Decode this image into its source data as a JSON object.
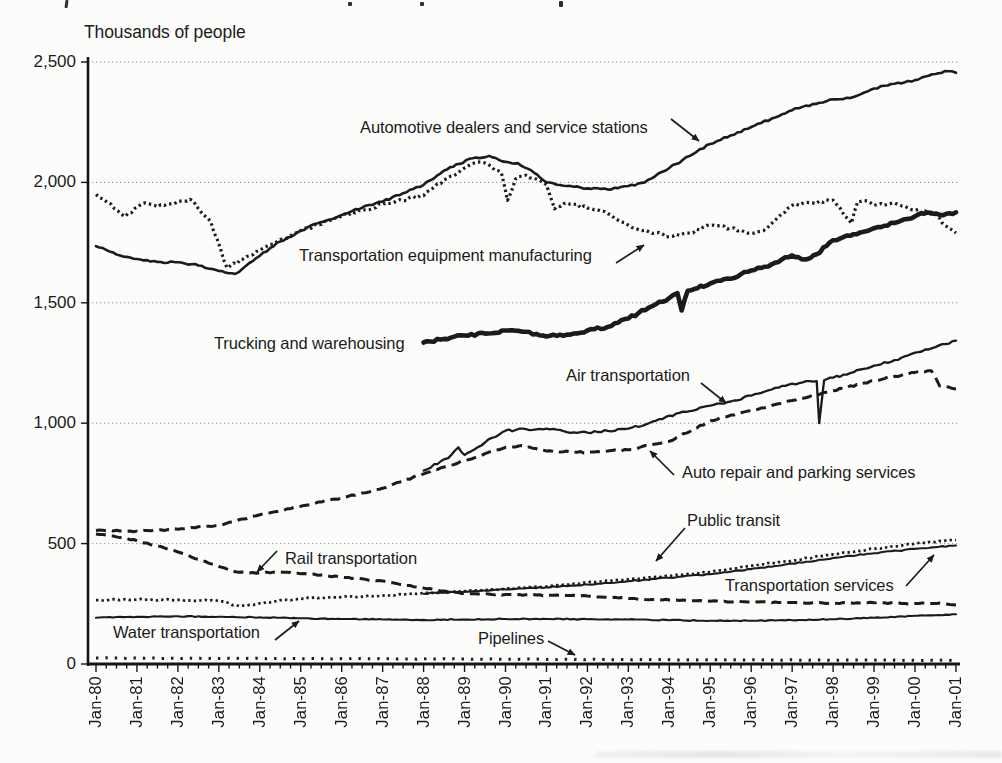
{
  "figure": {
    "y_axis_title": "Thousands of people",
    "ink_color": "#1b1b1b",
    "background_color": "#fcfcfb"
  },
  "chart_data": {
    "type": "line",
    "title": "",
    "ylabel": "Thousands of people",
    "xlabel": "",
    "ylim": [
      0,
      2500
    ],
    "x_range": [
      "Jan-80",
      "Jan-01"
    ],
    "grid": "horizontal dotted gridlines every 500",
    "legend_position": "inline annotations with arrows",
    "y_ticks": [
      {
        "v": 0,
        "label": "0"
      },
      {
        "v": 500,
        "label": "500"
      },
      {
        "v": 1000,
        "label": "1,000"
      },
      {
        "v": 1500,
        "label": "1,500"
      },
      {
        "v": 2000,
        "label": "2,000"
      },
      {
        "v": 2500,
        "label": "2,500"
      }
    ],
    "x_tick_labels": [
      "Jan-80",
      "Jan-81",
      "Jan-82",
      "Jan-83",
      "Jan-84",
      "Jan-85",
      "Jan-86",
      "Jan-87",
      "Jan-88",
      "Jan-89",
      "Jan-90",
      "Jan-91",
      "Jan-92",
      "Jan-93",
      "Jan-94",
      "Jan-95",
      "Jan-96",
      "Jan-97",
      "Jan-98",
      "Jan-99",
      "Jan-00",
      "Jan-01"
    ],
    "series": [
      {
        "id": "automotive-dealers",
        "name": "Automotive dealers and service stations",
        "line": "solid",
        "width": 2.6,
        "noise": 1.0,
        "x": [
          1980,
          1980.5,
          1981,
          1981.5,
          1982,
          1982.5,
          1983,
          1983.4,
          1984,
          1984.5,
          1985,
          1985.5,
          1986,
          1986.5,
          1987,
          1987.5,
          1988,
          1988.5,
          1988.8,
          1989.2,
          1989.6,
          1990,
          1990.3,
          1990.7,
          1991,
          1991.5,
          1992,
          1992.5,
          1993,
          1993.4,
          1994,
          1994.5,
          1995,
          1995.5,
          1996,
          1996.5,
          1997,
          1997.5,
          1998,
          1998.5,
          1999,
          1999.5,
          2000,
          2000.5,
          2000.8,
          2001
        ],
        "values": [
          1735,
          1700,
          1682,
          1670,
          1668,
          1655,
          1632,
          1620,
          1695,
          1755,
          1800,
          1835,
          1865,
          1895,
          1920,
          1955,
          1990,
          2050,
          2075,
          2100,
          2110,
          2085,
          2080,
          2040,
          2000,
          1985,
          1975,
          1970,
          1985,
          2000,
          2060,
          2110,
          2160,
          2195,
          2230,
          2265,
          2300,
          2325,
          2345,
          2355,
          2390,
          2410,
          2425,
          2450,
          2462,
          2455
        ]
      },
      {
        "id": "transportation-equipment-mfg",
        "name": "Transportation equipment manufacturing",
        "line": "dotted",
        "width": 3.2,
        "noise": 1.6,
        "x": [
          1980,
          1980.2,
          1980.7,
          1981.2,
          1981.5,
          1982,
          1982.3,
          1982.8,
          1983.2,
          1984,
          1985,
          1986,
          1987,
          1988,
          1988.5,
          1989,
          1989.4,
          1989.9,
          1990.05,
          1990.25,
          1990.5,
          1991,
          1991.2,
          1991.5,
          1992,
          1992.5,
          1993,
          1993.5,
          1994,
          1994.5,
          1995,
          1995.5,
          1996,
          1996.3,
          1997,
          1997.5,
          1998,
          1998.45,
          1998.6,
          1998.75,
          1999,
          1999.5,
          2000,
          2000.5,
          2000.75,
          2001
        ],
        "values": [
          1950,
          1928,
          1858,
          1915,
          1898,
          1922,
          1930,
          1838,
          1645,
          1718,
          1800,
          1862,
          1908,
          1945,
          2010,
          2060,
          2085,
          2040,
          1925,
          2015,
          2030,
          1990,
          1890,
          1915,
          1893,
          1870,
          1822,
          1795,
          1775,
          1790,
          1822,
          1810,
          1789,
          1800,
          1905,
          1915,
          1926,
          1830,
          1920,
          1925,
          1905,
          1915,
          1884,
          1868,
          1820,
          1790
        ]
      },
      {
        "id": "trucking-warehousing",
        "name": "Trucking and warehousing",
        "line": "solid",
        "width": 4.6,
        "noise": 1.3,
        "x": [
          1988,
          1988.5,
          1989,
          1989.5,
          1990,
          1990.5,
          1991,
          1991.5,
          1992,
          1992.5,
          1993,
          1993.5,
          1994,
          1994.2,
          1994.3,
          1994.45,
          1995,
          1995.5,
          1996,
          1996.5,
          1997,
          1997.3,
          1997.6,
          1998,
          1998.5,
          1999,
          1999.5,
          2000,
          2000.3,
          2000.6,
          2001
        ],
        "values": [
          1335,
          1350,
          1364,
          1372,
          1385,
          1380,
          1360,
          1368,
          1385,
          1400,
          1435,
          1480,
          1520,
          1540,
          1468,
          1550,
          1580,
          1600,
          1634,
          1660,
          1697,
          1680,
          1702,
          1760,
          1785,
          1810,
          1832,
          1859,
          1875,
          1865,
          1876
        ]
      },
      {
        "id": "air-transportation",
        "name": "Air transportation",
        "line": "solid",
        "width": 2.3,
        "noise": 1.1,
        "x": [
          1988,
          1988.6,
          1988.85,
          1989,
          1989.15,
          1989.5,
          1990,
          1990.5,
          1991,
          1991.5,
          1992,
          1992.5,
          1993,
          1993.5,
          1994,
          1994.5,
          1995,
          1995.5,
          1996,
          1996.5,
          1997,
          1997.6,
          1997.66,
          1997.78,
          1998,
          1998.5,
          1999,
          1999.5,
          2000,
          2000.5,
          2001
        ],
        "values": [
          803,
          855,
          900,
          868,
          882,
          920,
          969,
          975,
          977,
          963,
          961,
          968,
          977,
          1000,
          1031,
          1050,
          1073,
          1090,
          1114,
          1140,
          1164,
          1175,
          1000,
          1178,
          1189,
          1212,
          1239,
          1262,
          1293,
          1316,
          1343
        ]
      },
      {
        "id": "auto-repair-parking",
        "name": "Auto repair and parking services",
        "line": "dashed",
        "width": 3.0,
        "noise": 0.8,
        "x": [
          1980,
          1981,
          1982,
          1983,
          1984,
          1985,
          1986,
          1987,
          1988,
          1989,
          1990,
          1990.4,
          1991,
          1992,
          1993,
          1994,
          1995,
          1996,
          1997,
          1998,
          1999,
          2000,
          2000.4,
          2000.6,
          2001
        ],
        "values": [
          555,
          552,
          560,
          575,
          620,
          655,
          690,
          730,
          790,
          845,
          900,
          907,
          885,
          878,
          890,
          925,
          1010,
          1052,
          1094,
          1135,
          1177,
          1211,
          1218,
          1155,
          1142
        ]
      },
      {
        "id": "rail-transportation",
        "name": "Rail transportation",
        "line": "dashed",
        "width": 3.0,
        "noise": 0.6,
        "x": [
          1980,
          1980.5,
          1981,
          1981.5,
          1982,
          1982.5,
          1983,
          1983.4,
          1984,
          1984.5,
          1985,
          1985.5,
          1986,
          1987,
          1988,
          1989,
          1990,
          1991,
          1992,
          1993,
          1994,
          1995,
          1996,
          1997,
          1998,
          1999,
          2000,
          2000.7,
          2001
        ],
        "values": [
          540,
          528,
          512,
          490,
          465,
          435,
          405,
          383,
          378,
          382,
          375,
          370,
          360,
          345,
          315,
          293,
          288,
          286,
          283,
          272,
          266,
          261,
          258,
          255,
          253,
          254,
          251,
          252,
          245
        ]
      },
      {
        "id": "public-transit",
        "name": "Public transit",
        "line": "dotted",
        "width": 2.7,
        "noise": 0.7,
        "x": [
          1980,
          1981,
          1982,
          1983,
          1983.5,
          1984,
          1985,
          1986,
          1987,
          1988,
          1989,
          1990,
          1991,
          1992,
          1993,
          1994,
          1995,
          1996,
          1997,
          1998,
          1999,
          2000,
          2001
        ],
        "values": [
          265,
          268,
          266,
          262,
          240,
          252,
          272,
          278,
          284,
          295,
          302,
          312,
          322,
          338,
          352,
          365,
          382,
          408,
          430,
          455,
          478,
          500,
          515
        ]
      },
      {
        "id": "transportation-services",
        "name": "Transportation services",
        "line": "solid",
        "width": 2.1,
        "noise": 0.6,
        "x": [
          1988,
          1989,
          1990,
          1991,
          1992,
          1993,
          1994,
          1995,
          1996,
          1997,
          1998,
          1999,
          2000,
          2001
        ],
        "values": [
          292,
          300,
          310,
          319,
          330,
          344,
          358,
          373,
          394,
          417,
          440,
          460,
          478,
          492
        ]
      },
      {
        "id": "water-transportation",
        "name": "Water transportation",
        "line": "solid",
        "width": 2.1,
        "noise": 0.5,
        "x": [
          1980,
          1981,
          1982,
          1983,
          1984,
          1985,
          1986,
          1987,
          1988,
          1989,
          1990,
          1991,
          1992,
          1993,
          1994,
          1995,
          1996,
          1997,
          1998,
          1999,
          2000,
          2001
        ],
        "values": [
          192,
          196,
          198,
          196,
          194,
          190,
          187,
          185,
          183,
          185,
          187,
          187,
          186,
          185,
          182,
          180,
          180,
          182,
          186,
          192,
          200,
          207
        ]
      },
      {
        "id": "pipelines",
        "name": "Pipelines",
        "line": "dotted-sparse",
        "width": 3.0,
        "noise": 0.3,
        "x": [
          1980,
          1982,
          1984,
          1986,
          1988,
          1990,
          1992,
          1994,
          1996,
          1998,
          2000,
          2001
        ],
        "values": [
          25,
          24,
          23,
          22,
          21,
          20,
          19,
          18,
          17,
          16,
          15,
          15
        ]
      }
    ],
    "annotations": [
      {
        "id": "automotive-dealers",
        "text": "Automotive dealers and service stations",
        "x": 360,
        "y": 127,
        "arrow": [
          671,
          119,
          699,
          141
        ]
      },
      {
        "id": "transportation-equipment-mfg",
        "text": "Transportation equipment manufacturing",
        "x": 299,
        "y": 255,
        "arrow": [
          616,
          263,
          644,
          245
        ]
      },
      {
        "id": "trucking-warehousing",
        "text": "Trucking and warehousing",
        "x": 214,
        "y": 343,
        "arrow": null
      },
      {
        "id": "air-transportation",
        "text": "Air transportation",
        "x": 566,
        "y": 375,
        "arrow": [
          701,
          383,
          726,
          403
        ]
      },
      {
        "id": "auto-repair-parking",
        "text": "Auto repair and parking services",
        "x": 682,
        "y": 472,
        "arrow": [
          674,
          475,
          650,
          451
        ]
      },
      {
        "id": "rail-transportation",
        "text": "Rail transportation",
        "x": 285,
        "y": 558,
        "arrow": [
          277,
          551,
          257,
          572
        ]
      },
      {
        "id": "public-transit",
        "text": "Public transit",
        "x": 687,
        "y": 520,
        "arrow": [
          685,
          528,
          656,
          561
        ]
      },
      {
        "id": "transportation-services",
        "text": "Transportation services",
        "x": 725,
        "y": 585,
        "arrow": [
          906,
          586,
          934,
          555
        ]
      },
      {
        "id": "water-transportation",
        "text": "Water transportation",
        "x": 113,
        "y": 632,
        "arrow": [
          275,
          640,
          299,
          621
        ]
      },
      {
        "id": "pipelines",
        "text": "Pipelines",
        "x": 478,
        "y": 638,
        "arrow": [
          548,
          641,
          575,
          655
        ]
      }
    ]
  }
}
